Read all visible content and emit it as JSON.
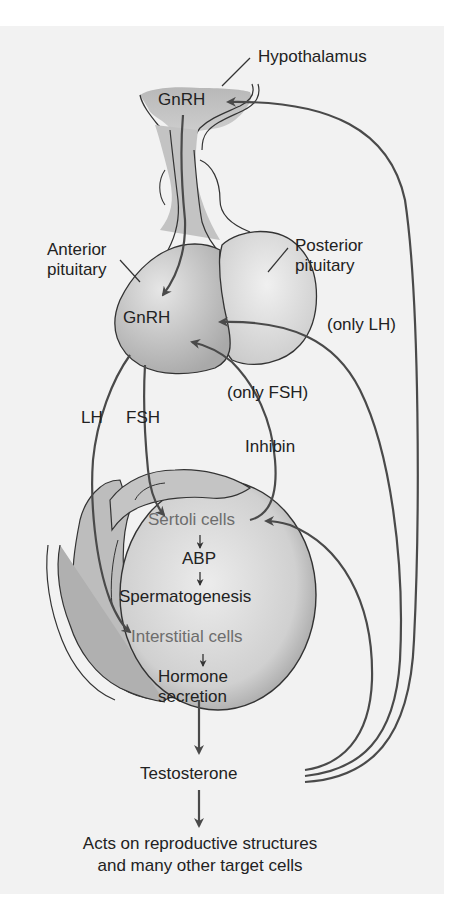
{
  "diagram": {
    "colors": {
      "background": "#f2f2f2",
      "tissue_dark": "#b5b5b5",
      "tissue_light": "#d9d9d9",
      "arrow": "#4a4a4a",
      "text": "#222222",
      "cell_text": "#6d6d6d"
    },
    "labels": {
      "hypothalamus": "Hypothalamus",
      "gnrh_top": "GnRH",
      "anterior_pituitary_line1": "Anterior",
      "anterior_pituitary_line2": "pituitary",
      "posterior_pituitary_line1": "Posterior",
      "posterior_pituitary_line2": "pituitary",
      "gnrh_pituitary": "GnRH",
      "only_lh": "(only LH)",
      "only_fsh": "(only FSH)",
      "lh": "LH",
      "fsh": "FSH",
      "inhibin": "Inhibin",
      "sertoli_cells": "Sertoli cells",
      "abp": "ABP",
      "spermatogenesis": "Spermatogenesis",
      "interstitial_cells": "Interstitial cells",
      "hormone_secretion_line1": "Hormone",
      "hormone_secretion_line2": "secretion",
      "testosterone": "Testosterone",
      "acts_line1": "Acts on reproductive structures",
      "acts_line2": "and many other target cells"
    },
    "flows": [
      {
        "from": "Hypothalamus GnRH",
        "to": "Anterior pituitary"
      },
      {
        "from": "Anterior pituitary",
        "to": "Interstitial cells",
        "label": "LH"
      },
      {
        "from": "Anterior pituitary",
        "to": "Sertoli cells",
        "label": "FSH"
      },
      {
        "from": "Sertoli cells",
        "to": "Anterior pituitary",
        "label": "Inhibin (only FSH)"
      },
      {
        "from": "Sertoli cells",
        "to": "ABP"
      },
      {
        "from": "ABP",
        "to": "Spermatogenesis"
      },
      {
        "from": "Interstitial cells",
        "to": "Hormone secretion"
      },
      {
        "from": "Hormone secretion",
        "to": "Testosterone"
      },
      {
        "from": "Testosterone",
        "to": "Sertoli cells"
      },
      {
        "from": "Testosterone",
        "to": "Anterior pituitary",
        "label": "(only LH)"
      },
      {
        "from": "Testosterone",
        "to": "Hypothalamus GnRH"
      },
      {
        "from": "Testosterone",
        "to": "Acts on reproductive structures and many other target cells"
      }
    ]
  }
}
